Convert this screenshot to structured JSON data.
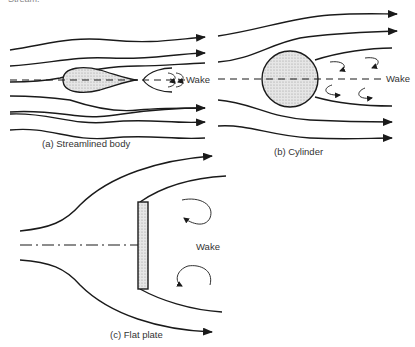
{
  "page": {
    "top_fragment": "Stream."
  },
  "figures": [
    {
      "id": "a",
      "caption": "(a) Streamlined body",
      "wake_label": "Wake"
    },
    {
      "id": "b",
      "caption": "(b) Cylinder",
      "wake_label": "Wake"
    },
    {
      "id": "c",
      "caption": "(c) Flat plate",
      "wake_label": "Wake"
    }
  ],
  "colors": {
    "stroke": "#1a1a1a",
    "body_fill": "#d8d8d8",
    "background": "#ffffff"
  }
}
